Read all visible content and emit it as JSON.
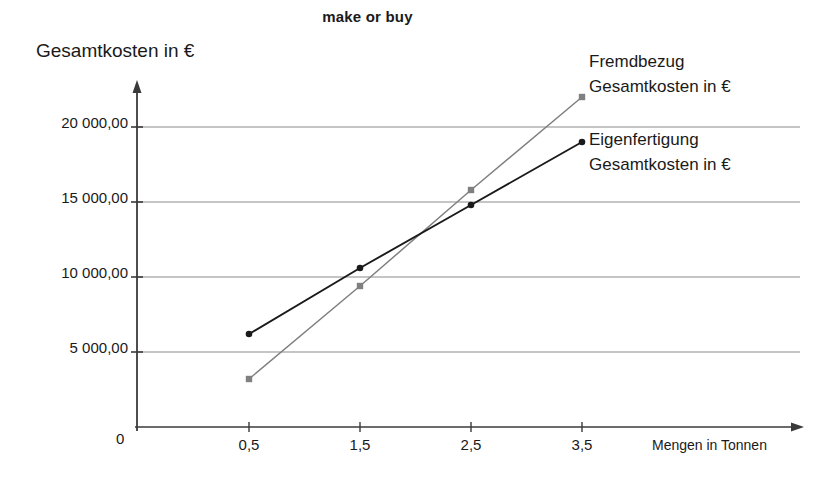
{
  "chart_data": {
    "type": "line",
    "title": "make or buy",
    "xlabel": "Mengen in Tonnen",
    "ylabel": "Gesamtkosten in €",
    "x": [
      0.5,
      1.5,
      2.5,
      3.5
    ],
    "x_tick_labels": [
      "0,5",
      "1,5",
      "2,5",
      "3,5"
    ],
    "origin_label": "0",
    "y_tick_values": [
      5000,
      10000,
      15000,
      20000
    ],
    "y_tick_labels": [
      "5 000,00",
      "10 000,00",
      "15 000,00",
      "20 000,00"
    ],
    "ylim": [
      0,
      23500
    ],
    "xlim": [
      0,
      4.45
    ],
    "grid": "horizontal",
    "legend_position": "right-inline",
    "series": [
      {
        "name": "Fremdbezug Gesamtkosten in €",
        "label_line1": "Fremdbezug",
        "label_line2": "Gesamtkosten in €",
        "color": "#808080",
        "marker": "square",
        "values": [
          3200,
          9400,
          15800,
          22000
        ]
      },
      {
        "name": "Eigenfertigung Gesamtkosten in €",
        "label_line1": "Eigenfertigung",
        "label_line2": "Gesamtkosten in €",
        "color": "#1a1a1a",
        "marker": "circle",
        "values": [
          6200,
          10600,
          14800,
          19000
        ]
      }
    ]
  },
  "legend": {
    "fremdbezug": {
      "line1": "Fremdbezug",
      "line2": "Gesamtkosten in €"
    },
    "eigenfertigung": {
      "line1": "Eigenfertigung",
      "line2": "Gesamtkosten in €"
    }
  },
  "axes": {
    "y_title": "Gesamtkosten in €",
    "x_title": "Mengen in Tonnen",
    "origin": "0",
    "y_labels": [
      "20 000,00",
      "15 000,00",
      "10 000,00",
      "5 000,00"
    ],
    "x_labels": [
      "0,5",
      "1,5",
      "2,5",
      "3,5"
    ]
  },
  "colors": {
    "series_fremdbezug": "#808080",
    "series_eigenfertigung": "#1a1a1a",
    "grid": "#8c8c8c",
    "axis": "#3a3a3a",
    "background": "#ffffff"
  }
}
